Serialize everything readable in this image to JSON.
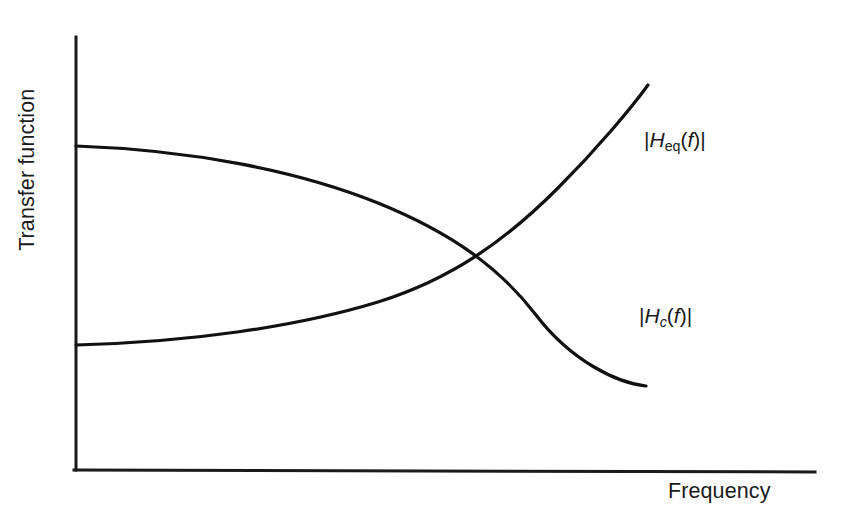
{
  "figure": {
    "background_color": "#ffffff",
    "line_color": "#111111",
    "axis_color": "#1a1a1a",
    "y_axis_label": "Transfer function",
    "x_axis_label": "Frequency",
    "curve_labels": {
      "equalizer": {
        "full_text": "|Heq(f)|",
        "open_bar": "|",
        "h": "H",
        "subscript": "eq",
        "paren_open": "(",
        "f": "f",
        "paren_close": ")",
        "close_bar": "|"
      },
      "channel": {
        "full_text": "|Hc(f)|",
        "open_bar": "|",
        "h": "H",
        "subscript": "c",
        "paren_open": "(",
        "f": "f",
        "paren_close": ")",
        "close_bar": "|"
      }
    }
  },
  "chart_data": {
    "type": "line",
    "title": "",
    "subtitle": "",
    "xlabel": "Frequency",
    "ylabel": "Transfer function",
    "xlim": [
      0,
      1
    ],
    "ylim": [
      0,
      1
    ],
    "grid": false,
    "axis_ticks": {
      "x": [],
      "y": []
    },
    "legend": {
      "position": "inline-right",
      "entries": [
        "|Heq(f)|",
        "|Hc(f)|"
      ]
    },
    "annotations": [
      {
        "text": "|Heq(f)|",
        "attached_to": "equalizer",
        "pixel_position": [
          644,
          140
        ]
      },
      {
        "text": "|Hc(f)|",
        "attached_to": "channel",
        "pixel_position": [
          639,
          316
        ]
      }
    ],
    "axes_pixel_geometry": {
      "y_axis": {
        "x": 76,
        "y_top": 37,
        "y_bottom": 470
      },
      "x_axis": {
        "y": 470,
        "x_left": 74,
        "x_right": 815
      }
    },
    "series": [
      {
        "name": "|Hc(f)|",
        "description": "Channel transfer function: starts high at low frequency, rolls off and falls steeply at high frequency",
        "pixel_path": "M 76,146 C 190,150 300,172 380,205 C 462,239 505,276 540,320 C 575,364 616,382 646,386",
        "points_pixels": [
          [
            76,
            146
          ],
          [
            160,
            152
          ],
          [
            250,
            168
          ],
          [
            350,
            190
          ],
          [
            440,
            222
          ],
          [
            500,
            252
          ],
          [
            530,
            245
          ],
          [
            560,
            296
          ],
          [
            600,
            340
          ],
          [
            630,
            370
          ],
          [
            646,
            386
          ]
        ],
        "normalized_points": [
          [
            0.0,
            0.75
          ],
          [
            0.11,
            0.73
          ],
          [
            0.23,
            0.7
          ],
          [
            0.37,
            0.65
          ],
          [
            0.49,
            0.57
          ],
          [
            0.57,
            0.5
          ],
          [
            0.62,
            0.52
          ],
          [
            0.65,
            0.4
          ],
          [
            0.71,
            0.3
          ],
          [
            0.75,
            0.23
          ],
          [
            0.77,
            0.19
          ]
        ]
      },
      {
        "name": "|Heq(f)|",
        "description": "Equalizer transfer function: starts low at low frequency, rises and climbs steeply at high frequency (inverse of channel)",
        "pixel_path": "M 76,345 C 190,342 300,326 380,300 C 462,272 508,238 560,186 C 600,146 632,106 648,85",
        "points_pixels": [
          [
            76,
            345
          ],
          [
            160,
            341
          ],
          [
            250,
            332
          ],
          [
            350,
            312
          ],
          [
            440,
            282
          ],
          [
            500,
            254
          ],
          [
            530,
            245
          ],
          [
            570,
            196
          ],
          [
            610,
            140
          ],
          [
            635,
            105
          ],
          [
            648,
            85
          ]
        ],
        "normalized_points": [
          [
            0.0,
            0.29
          ],
          [
            0.11,
            0.3
          ],
          [
            0.23,
            0.32
          ],
          [
            0.37,
            0.36
          ],
          [
            0.49,
            0.43
          ],
          [
            0.57,
            0.5
          ],
          [
            0.62,
            0.52
          ],
          [
            0.67,
            0.63
          ],
          [
            0.72,
            0.76
          ],
          [
            0.76,
            0.84
          ],
          [
            0.78,
            0.89
          ]
        ]
      }
    ],
    "intersection_point_pixels": [
      530,
      245
    ]
  }
}
